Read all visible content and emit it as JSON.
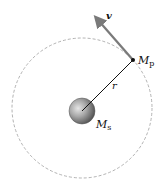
{
  "diagram": {
    "labels": {
      "velocity": "v",
      "planet_mass": "M",
      "planet_sub": "p",
      "radius": "r",
      "star_mass": "M",
      "star_sub": "s"
    },
    "colors": {
      "orbit": "#9a9a9a",
      "arrow": "#7a7a7a",
      "radius_line": "#111111",
      "star_light": "#d8d8d8",
      "star_dark": "#555555"
    }
  }
}
